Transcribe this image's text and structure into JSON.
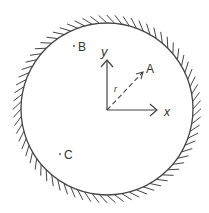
{
  "diagram": {
    "boundary": {
      "cx": 107,
      "cy": 109,
      "r": 86,
      "hatch_count": 72,
      "hatch_len": 8,
      "color": "#444444"
    },
    "origin": {
      "x": 107,
      "y": 110
    },
    "axes": {
      "x": {
        "label": "x",
        "tip": [
          157,
          110
        ]
      },
      "y": {
        "label": "y",
        "tip": [
          107,
          60
        ]
      }
    },
    "vector": {
      "label": "r",
      "target_label": "A",
      "tip": [
        143,
        72
      ],
      "style": "dashed"
    },
    "points": [
      {
        "label": "B",
        "x": 74,
        "y": 46
      },
      {
        "label": "C",
        "x": 60,
        "y": 154
      }
    ],
    "labels": {
      "y": "y",
      "x": "x",
      "A": "A",
      "r": "r",
      "B": "B",
      "C": "C"
    }
  }
}
